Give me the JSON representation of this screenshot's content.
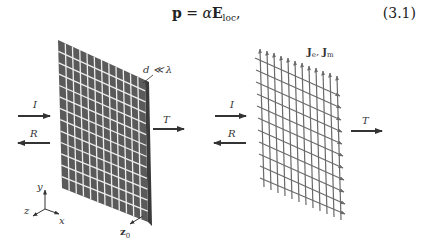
{
  "equation": {
    "lhs": "p",
    "equals": " = ",
    "alpha": "α",
    "field": "E",
    "field_subscript": "loc",
    "trailing": ",",
    "number": "(3.1)"
  },
  "figure": {
    "left_panel": {
      "incident_label": "I",
      "reflected_label": "R",
      "transmitted_label": "T",
      "spacing_label": "d ≪ λ",
      "normal_label": "z",
      "normal_subscript": "0",
      "axes": {
        "x": "x",
        "y": "y",
        "z": "z"
      }
    },
    "right_panel": {
      "incident_label": "I",
      "reflected_label": "R",
      "transmitted_label": "T",
      "currents_label_e": "J",
      "currents_sub_e": "e",
      "currents_sep": ", ",
      "currents_label_m": "J",
      "currents_sub_m": "m"
    },
    "colors": {
      "panel_fill": "#5a5a5a",
      "panel_edge": "#3a3a3a",
      "grid_line": "#f0f0f0",
      "arrow": "#333333",
      "current_arrow": "#6a6a6a"
    }
  }
}
